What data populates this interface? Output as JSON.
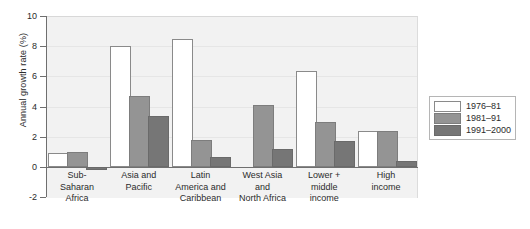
{
  "chart_data": {
    "type": "bar",
    "title": "",
    "xlabel": "",
    "ylabel": "Annual growth rate (%)",
    "ylim": [
      -2,
      10
    ],
    "yticks": [
      -2,
      0,
      2,
      4,
      6,
      8,
      10
    ],
    "ytick_labels": [
      "-2",
      "0",
      "2",
      "4",
      "6",
      "8",
      "10"
    ],
    "grid": true,
    "legend_position": "right",
    "categories": [
      "Sub-\nSaharan\nAfrica",
      "Asia and\nPacific",
      "Latin\nAmerica and\nCaribbean",
      "West Asia\nand\nNorth Africa",
      "Lower +\nmiddle\nincome",
      "High\nincome"
    ],
    "series": [
      {
        "name": "1976–81",
        "color": "#ffffff",
        "values": [
          0.9,
          8.0,
          8.5,
          0.0,
          6.35,
          2.4
        ]
      },
      {
        "name": "1981–91",
        "color": "#949494",
        "values": [
          1.0,
          4.7,
          1.8,
          4.1,
          3.0,
          2.4
        ]
      },
      {
        "name": "1991–2000",
        "color": "#767676",
        "values": [
          -0.2,
          3.4,
          0.65,
          1.15,
          1.7,
          0.4
        ]
      }
    ]
  },
  "legend": {
    "items": [
      {
        "label": "1976–81"
      },
      {
        "label": "1981–91"
      },
      {
        "label": "1991–2000"
      }
    ]
  }
}
